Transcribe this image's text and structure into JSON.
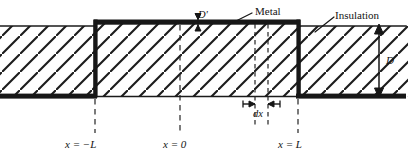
{
  "figure": {
    "type": "cross-section-diagram",
    "colors": {
      "ink": "#141414",
      "metal": "#171717",
      "hatch": "#1c1c1c",
      "background": "#ffffff",
      "dashed": "#232323"
    },
    "labels": {
      "metal": "Metal",
      "insulation": "Insulation",
      "d_prime": "D'",
      "d": "D",
      "dx": "dx",
      "x_neg_L": "x = −L",
      "x_zero": "x = 0",
      "x_L": "x = L"
    },
    "annotations": [
      {
        "name": "metal-layer-thickness",
        "symbol": "D'",
        "kind": "dimension-double-arrow",
        "orientation": "vertical"
      },
      {
        "name": "slab-thickness",
        "symbol": "D",
        "kind": "dimension-double-arrow",
        "orientation": "vertical"
      },
      {
        "name": "differential-element",
        "symbol": "dx",
        "kind": "dimension-double-arrow",
        "orientation": "horizontal"
      },
      {
        "name": "metal-leader",
        "symbol": "Metal",
        "kind": "leader-line"
      },
      {
        "name": "insulation-leader",
        "symbol": "Insulation",
        "kind": "leader-line"
      }
    ],
    "axis_marks": [
      {
        "label": "x = −L",
        "x": 95
      },
      {
        "label": "x = 0",
        "x": 180
      },
      {
        "label": "x = L",
        "x": 298
      }
    ],
    "geometry": {
      "slab_top_y": 22,
      "slab_bottom_y": 97,
      "step_top_y": 22,
      "outer_top_y": 26,
      "left_boundary_x": 95,
      "right_boundary_x": 298,
      "dx_left": 255,
      "dx_right": 268
    }
  }
}
